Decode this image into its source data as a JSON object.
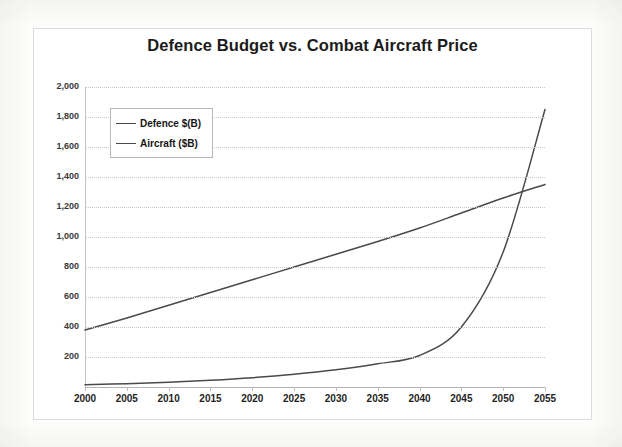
{
  "document": {
    "kind": "scanned-chart-figure",
    "background_color": "#fdfdfc",
    "frame_color": "#dcdcdc"
  },
  "chart_data": {
    "type": "line",
    "title": "Defence Budget vs. Combat Aircraft Price",
    "xlabel": "",
    "ylabel": "",
    "xlim": [
      2000,
      2055
    ],
    "ylim": [
      0,
      2000
    ],
    "grid": true,
    "legend_position": "top-left",
    "x": [
      2000,
      2005,
      2010,
      2015,
      2020,
      2025,
      2030,
      2035,
      2040,
      2045,
      2050,
      2055
    ],
    "categories": [
      "2000",
      "2005",
      "2010",
      "2015",
      "2020",
      "2025",
      "2030",
      "2035",
      "2040",
      "2045",
      "2050",
      "2055"
    ],
    "ytick_labels": [
      "",
      "200",
      "400",
      "600",
      "800",
      "1,000",
      "1,200",
      "1,400",
      "1,600",
      "1,800",
      "2,000"
    ],
    "ytick_values": [
      0,
      200,
      400,
      600,
      800,
      1000,
      1200,
      1400,
      1600,
      1800,
      2000
    ],
    "series": [
      {
        "name": "Defence $(B)",
        "color": "#4a4a4a",
        "values": [
          380,
          460,
          545,
          630,
          715,
          800,
          885,
          970,
          1060,
          1160,
          1260,
          1350
        ]
      },
      {
        "name": "Aircraft ($B)",
        "color": "#4a4a4a",
        "values": [
          15,
          22,
          32,
          45,
          62,
          85,
          115,
          155,
          210,
          400,
          900,
          1850
        ]
      }
    ],
    "annotations": {
      "crossover_note": "Aircraft price curve crosses defence budget line near 2051"
    }
  },
  "legend": {
    "items": [
      {
        "label": "Defence $(B)"
      },
      {
        "label": "Aircraft ($B)"
      }
    ]
  }
}
